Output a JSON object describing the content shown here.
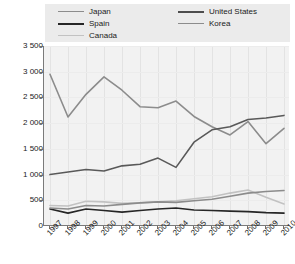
{
  "chart_data": {
    "type": "line",
    "title": "",
    "subtitle": "",
    "xlabel": "",
    "ylabel": "",
    "grid": true,
    "legend_position": "top",
    "x": [
      "1997",
      "1998",
      "1999",
      "2000",
      "2001",
      "2002",
      "2003",
      "2004",
      "2005",
      "2006",
      "2007",
      "2008",
      "2009",
      "2010"
    ],
    "xlim": [
      1997,
      2010
    ],
    "ylim": [
      0,
      3500
    ],
    "ytick_labels": [
      "0",
      "500",
      "1 000",
      "1 500",
      "2 000",
      "2 500",
      "3 000",
      "3 500"
    ],
    "ytick_values": [
      0,
      500,
      1000,
      1500,
      2000,
      2500,
      3000,
      3500
    ],
    "ytick_step": 500,
    "series": [
      {
        "name": "Japan",
        "color": "#8c8c8c",
        "width": 1.6,
        "values": [
          2950,
          2120,
          2560,
          2900,
          2640,
          2320,
          2300,
          2430,
          2130,
          1930,
          1770,
          2030,
          1600,
          1900
        ]
      },
      {
        "name": "Spain",
        "color": "#262626",
        "width": 1.6,
        "values": [
          330,
          250,
          330,
          300,
          270,
          300,
          330,
          350,
          310,
          300,
          290,
          280,
          260,
          250
        ]
      },
      {
        "name": "Canada",
        "color": "#c2c2c2",
        "width": 1.6,
        "values": [
          400,
          390,
          480,
          470,
          440,
          450,
          470,
          490,
          530,
          570,
          640,
          700,
          560,
          430
        ]
      },
      {
        "name": "United States",
        "color": "#595959",
        "width": 1.6,
        "values": [
          1000,
          1050,
          1100,
          1070,
          1170,
          1200,
          1320,
          1140,
          1630,
          1870,
          1930,
          2070,
          2100,
          2150
        ]
      },
      {
        "name": "Korea",
        "color": "#8c8c8c",
        "width": 1.6,
        "values": [
          350,
          330,
          400,
          390,
          420,
          450,
          470,
          460,
          490,
          520,
          580,
          640,
          670,
          690
        ]
      }
    ]
  },
  "legend": {
    "columns": [
      {
        "items": [
          {
            "label": "Japan",
            "color": "#8c8c8c",
            "width": 1.6
          },
          {
            "label": "Spain",
            "color": "#262626",
            "width": 2.2
          },
          {
            "label": "Canada",
            "color": "#c2c2c2",
            "width": 1.6
          }
        ]
      },
      {
        "items": [
          {
            "label": "United States",
            "color": "#4d4d4d",
            "width": 2.2
          },
          {
            "label": "Korea",
            "color": "#8c8c8c",
            "width": 1.6
          }
        ]
      }
    ]
  }
}
